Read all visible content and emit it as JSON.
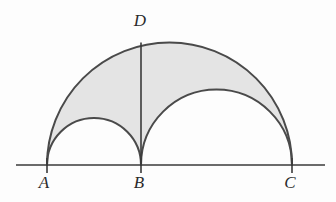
{
  "figure": {
    "width": 336,
    "height": 202,
    "background_color": "#fdfdfd",
    "stroke_color": "#4a4a4a",
    "stroke_width": 2,
    "shade_color": "#e4e4e4",
    "baseline": {
      "name": "baseline",
      "x1": 16,
      "y1": 165,
      "x2": 325,
      "y2": 165,
      "color": "#3a3a3a",
      "width": 1.6
    },
    "points": [
      {
        "id": "A",
        "label": "A",
        "x": 47,
        "y": 165,
        "label_x": 44,
        "label_y": 182
      },
      {
        "id": "B",
        "label": "B",
        "x": 141,
        "y": 165,
        "label_x": 139,
        "label_y": 182
      },
      {
        "id": "C",
        "label": "C",
        "x": 292,
        "y": 165,
        "label_x": 290,
        "label_y": 182
      },
      {
        "id": "D",
        "label": "D",
        "x": 141,
        "y": 42,
        "label_x": 140,
        "label_y": 20
      }
    ],
    "semicircles": [
      {
        "id": "AC",
        "name": "large-semicircle-AC",
        "center_x": 169.5,
        "center_y": 165,
        "radius": 122.5,
        "apex_y": 42.5
      },
      {
        "id": "AB",
        "name": "small-semicircle-AB",
        "center_x": 94.0,
        "center_y": 165,
        "radius": 47.0,
        "apex_y": 118.0
      },
      {
        "id": "BC",
        "name": "medium-semicircle-BC",
        "center_x": 216.5,
        "center_y": 165,
        "radius": 75.5,
        "apex_y": 89.5
      }
    ],
    "segments": [
      {
        "id": "BD",
        "name": "segment-BD",
        "x1": 141,
        "y1": 165,
        "x2": 141,
        "y2": 42,
        "color": "#3a3a3a",
        "width": 1.6
      }
    ],
    "shaded_region": {
      "name": "arbelos-shaded-region",
      "description": "Region inside semicircle on AC and outside semicircles on AB and BC",
      "fill": "#e4e4e4",
      "path": "M 47 165 A 122.5 122.5 0 0 1 292 165 L 292 165 A 75.5 75.5 0 0 0 141 165 A 47 47 0 0 0 47 165 Z"
    }
  }
}
